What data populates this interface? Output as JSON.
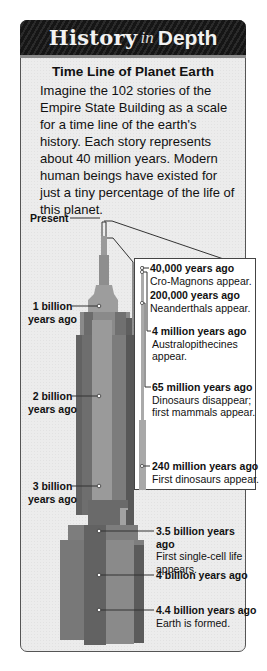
{
  "header": {
    "word1": "History",
    "word2": "in",
    "word3": "Depth"
  },
  "feature": {
    "title": "Time Line of Planet Earth",
    "intro": "Imagine the 102 stories of the Empire State Building as a scale for a time line of the earth's history. Each story represents about 40 million years. Modern human beings have existed for just a tiny percentage of the life of this planet."
  },
  "left_labels": [
    {
      "line1": "Present",
      "line2": ""
    },
    {
      "line1": "1 billion",
      "line2": "years ago"
    },
    {
      "line1": "2 billion",
      "line2": "years ago"
    },
    {
      "line1": "3 billion",
      "line2": "years ago"
    }
  ],
  "inset_events": [
    {
      "time": "40,000 years ago",
      "event": "Cro-Magnons appear."
    },
    {
      "time": "200,000 years ago",
      "event": "Neanderthals appear."
    },
    {
      "time": "4 million years ago",
      "event": "Australopithecines appear."
    },
    {
      "time": "65 million years ago",
      "event": "Dinosaurs disappear; first mammals appear."
    },
    {
      "time": "240 million years ago",
      "event": "First dinosaurs appear."
    }
  ],
  "base_events": [
    {
      "time": "3.5 billion years ago",
      "event": "First single-cell life appears."
    },
    {
      "time": "4 billion years ago",
      "event": ""
    },
    {
      "time": "4.4 billion years ago",
      "event": "Earth is formed."
    }
  ],
  "colors": {
    "banner": "#1a1a1a",
    "card": "#ececec",
    "building_light": "#9a9a9a",
    "building_mid": "#7a7a7a",
    "building_dark": "#5e5e5e"
  }
}
